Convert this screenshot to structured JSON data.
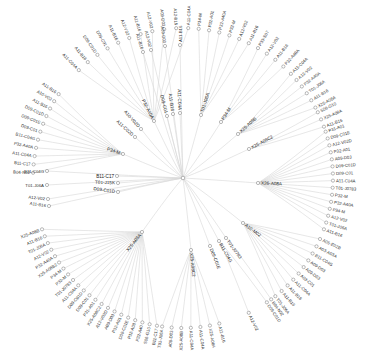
{
  "diagram": {
    "type": "radial-dendrogram",
    "root": {
      "x": 183,
      "y": 178
    },
    "colors": {
      "link": "#d6d6d6",
      "node_stroke": "#8a8a8a",
      "label": "#333333",
      "background": "#ffffff"
    },
    "groups": [
      {
        "id": "P34-M-left",
        "label": "P34-M",
        "x": 123,
        "y": 154,
        "angle": 198,
        "leaves": [
          "A11-B16",
          "A10-V02",
          "A11-B16",
          "D09-C01D",
          "D09-C01E",
          "D09-C01",
          "B11-C04G",
          "P32-A40A",
          "A11-C04A",
          "B11-C17",
          "B04-N02"
        ],
        "leaf_angle_range": [
          214,
          182
        ]
      },
      {
        "id": "A11-C02D",
        "label": "A11-C02D",
        "x": 135,
        "y": 137,
        "angle": 222,
        "leaves": []
      },
      {
        "id": "A10-V02D",
        "label": "A10-V02D",
        "x": 141,
        "y": 129,
        "angle": 228,
        "leaves": []
      },
      {
        "id": "P32-A40A",
        "label": "P32-A40A",
        "x": 154,
        "y": 121,
        "angle": 243,
        "leaves": [
          "A11-C04A",
          "A11-B16",
          "D09-C01D",
          "D09-C01",
          "A11-B16",
          "A12-V02",
          "A11-B16",
          "A12-V02",
          "A09-D03",
          "A12-B16",
          "A11-C04A"
        ],
        "leaf_angle_range": [
          226,
          272
        ]
      },
      {
        "id": "D09-C01",
        "label": "D09-C01",
        "x": 167,
        "y": 116,
        "angle": 256,
        "leaves": []
      },
      {
        "id": "A11-B16-up",
        "label": "A11-B16",
        "x": 173,
        "y": 114,
        "angle": 262,
        "leaves": []
      },
      {
        "id": "A11-C04A-up",
        "label": "A11-C04A",
        "x": 180,
        "y": 113,
        "angle": 268,
        "leaves": []
      },
      {
        "id": "T01-J06A",
        "label": "T01-J06A",
        "x": 201,
        "y": 115,
        "angle": 288,
        "leaves": [
          "P34-M",
          "P32-A01",
          "P32-A40A",
          "P32-M",
          "A12-V02",
          "A11-B16"
        ],
        "leaf_angle_range": [
          276,
          296
        ]
      },
      {
        "id": "P34-M-up",
        "label": "P34-M",
        "x": 221,
        "y": 122,
        "angle": 302,
        "leaves": [
          "P33-S07",
          "A12-V02",
          "A11-B16",
          "P32-A40A"
        ],
        "leaf_angle_range": [
          300,
          312
        ]
      },
      {
        "id": "X25-A08B",
        "label": "X25-A08B",
        "x": 238,
        "y": 134,
        "angle": 318,
        "leaves": [
          "A11-C04A",
          "A12-V02",
          "P32-A40A",
          "T01-J06A",
          "A11-B16",
          "X25-A08A"
        ],
        "leaf_angle_range": [
          316,
          332
        ]
      },
      {
        "id": "X25-A08C2",
        "label": "X25-A08C2",
        "x": 249,
        "y": 149,
        "angle": 332,
        "leaves": [
          "S06-G10",
          "X25-A08A",
          "A11-B16"
        ],
        "leaf_angle_range": [
          334,
          340
        ]
      },
      {
        "id": "X26-A08A",
        "label": "X26-A08A",
        "x": 258,
        "y": 183,
        "angle": 2,
        "leaves": [
          "P31-A01",
          "D09-C01E",
          "A12-V02D",
          "P32-A01",
          "A09-D03",
          "D09-C01D",
          "D09-C01",
          "A11-C04A",
          "T01-J0783",
          "P32-M",
          "P32-A40A",
          "P34-M",
          "A12-V02",
          "T01-J06A",
          "A11-B16"
        ],
        "leaf_angle_range": [
          342,
          20
        ]
      },
      {
        "id": "A10-M02",
        "label": "A10-M02",
        "x": 243,
        "y": 223,
        "angle": 36,
        "leaves": [
          "A05-E02B",
          "A03-A03A",
          "B11-C04G",
          "A09-D03",
          "A09-D03",
          "A03-C01",
          "A11-C04A",
          "A11-B16",
          "A11-B16",
          "T01-J06A"
        ],
        "leaf_angle_range": [
          24,
          52
        ]
      },
      {
        "id": "T01-J0783",
        "label": "T01-J0783",
        "x": 226,
        "y": 238,
        "angle": 54,
        "leaves": [
          "B04-N02"
        ]
      },
      {
        "id": "B11-C04G",
        "label": "B11-C04G",
        "x": 219,
        "y": 241,
        "angle": 60,
        "leaves": [
          "D09-C01D",
          "A12-V02"
        ]
      },
      {
        "id": "D09-C01E",
        "label": "D09-C01E",
        "x": 210,
        "y": 246,
        "angle": 68,
        "leaves": []
      },
      {
        "id": "X25-A08C2-low",
        "label": "X25-A08C2",
        "x": 191,
        "y": 250,
        "angle": 84,
        "leaves": [
          "A11-B16",
          "X25-A08A",
          "A11-C04A",
          "A11-C04A",
          "X25-A08B",
          "A09-D03",
          "T01-J06A"
        ],
        "leaf_angle_range": [
          76,
          98
        ]
      },
      {
        "id": "X26-A08A-left",
        "label": "X25-A08A",
        "x": 142,
        "y": 232,
        "angle": 128,
        "leaves": [
          "X25-A08B",
          "A11-B16",
          "T01-J06A",
          "A12-V02",
          "P32-A40A",
          "X25-A08B2",
          "P34-M",
          "P32-M",
          "T01-J0783",
          "A11-C04A",
          "D09-C01D",
          "D09-C01",
          "P31-A01",
          "X25-A08C2",
          "A12-V02D",
          "A09-D03",
          "P32-A01",
          "D09-C01E",
          "P32-A08",
          "P32-A40",
          "S06-G10",
          "B11-C17"
        ],
        "leaf_angle_range": [
          160,
          100
        ]
      },
      {
        "id": "B11-C17",
        "label": "B11-C17",
        "x": 117,
        "y": 176,
        "angle": 180,
        "leaves": []
      },
      {
        "id": "T01-J15K",
        "label": "T01-J15K",
        "x": 118,
        "y": 183,
        "angle": 182,
        "leaves": []
      },
      {
        "id": "D09-C01D",
        "label": "D09-C01D",
        "x": 118,
        "y": 192,
        "angle": 188,
        "leaves": []
      }
    ],
    "direct_leaves": [
      {
        "label": "A11-B16",
        "x": 180,
        "y": 45,
        "angle": 270
      },
      {
        "label": "A09-D03",
        "x": 165,
        "y": 46,
        "angle": 262
      },
      {
        "label": "A12-V02",
        "x": 151,
        "y": 50,
        "angle": 256
      },
      {
        "label": "A11-B16",
        "x": 143,
        "y": 52,
        "angle": 253
      },
      {
        "label": "B11-C04G",
        "x": 47,
        "y": 171,
        "angle": 180
      },
      {
        "label": "T01-J06A",
        "x": 47,
        "y": 185,
        "angle": 180
      },
      {
        "label": "A12-V02",
        "x": 48,
        "y": 199,
        "angle": 186
      },
      {
        "label": "A11-B16",
        "x": 49,
        "y": 206,
        "angle": 188
      }
    ]
  }
}
